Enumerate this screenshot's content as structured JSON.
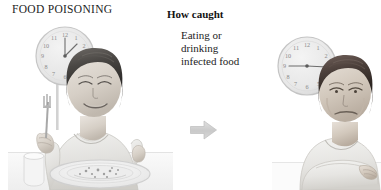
{
  "panel": {
    "title": "FOOD POISONING",
    "background_color": "#ffffff",
    "text_color": "#232323"
  },
  "section": {
    "heading": "How caught",
    "body_lines": [
      "Eating or",
      "drinking",
      "infected food"
    ]
  },
  "arrow": {
    "name": "right-arrow",
    "direction": "right",
    "color": "#cfcfcf"
  },
  "illustrations": [
    {
      "id": "before",
      "name": "child-eating-meal-with-clock",
      "description": "Pencil drawing of a child seated at a table eating a plate of food, holding a fork, with a wall clock behind",
      "clock_time": "12:00",
      "tone": "#9a9a9a"
    },
    {
      "id": "after",
      "name": "child-unwell-with-clock",
      "description": "Pencil drawing of the same child resting arms on a table looking unwell, with a wall clock behind",
      "clock_time": "9:15",
      "tone": "#9a9a9a"
    }
  ]
}
